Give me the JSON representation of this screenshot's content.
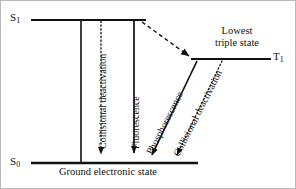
{
  "figure": {
    "type": "jablonski-energy-level-diagram",
    "stroke_color": "#111111",
    "background_color": "#ffffff",
    "border_color": "#b9b9b9"
  },
  "states": {
    "excited_singlet": {
      "label": "S",
      "subscript": "1",
      "full_label": "S1",
      "line": {
        "x1": 30,
        "x2": 145,
        "y": 19
      }
    },
    "ground_singlet": {
      "label": "S",
      "subscript": "0",
      "full_label": "S0",
      "line": {
        "x1": 30,
        "x2": 197,
        "y": 162
      }
    },
    "triplet": {
      "label": "T",
      "subscript": "1",
      "full_label": "T1",
      "line": {
        "x1": 190,
        "x2": 270,
        "y": 58
      }
    }
  },
  "annotations": {
    "ground_state_caption": "Ground electronic state",
    "lowest_triple_state_line1": "Lowest",
    "lowest_triple_state_line2": "triple state"
  },
  "transitions": [
    {
      "name": "collisional-deactivation-singlet",
      "label": "Collisional deactivation",
      "style": "dotted",
      "arrow": true,
      "from": {
        "x": 100,
        "y": 19
      },
      "to": {
        "x": 100,
        "y": 160
      }
    },
    {
      "name": "fluorescence",
      "label": "Fluorescence",
      "style": "solid",
      "arrow": true,
      "from": {
        "x": 133,
        "y": 19
      },
      "to": {
        "x": 133,
        "y": 160
      }
    },
    {
      "name": "intersystem-crossing",
      "label": "",
      "style": "dashed",
      "arrow": true,
      "from": {
        "x": 141,
        "y": 21
      },
      "to": {
        "x": 190,
        "y": 56
      }
    },
    {
      "name": "phosphorescence",
      "label": "Phosphorescence",
      "style": "solid",
      "arrow": true,
      "from": {
        "x": 196,
        "y": 60
      },
      "to": {
        "x": 149,
        "y": 159
      }
    },
    {
      "name": "collisional-deactivation-triplet",
      "label": "Collisional deactivation",
      "style": "dotted",
      "arrow": true,
      "from": {
        "x": 220,
        "y": 60
      },
      "to": {
        "x": 174,
        "y": 159
      }
    },
    {
      "name": "left-boundary-connector",
      "label": "",
      "style": "solid",
      "arrow": false,
      "from": {
        "x": 80,
        "y": 19
      },
      "to": {
        "x": 80,
        "y": 162
      }
    }
  ]
}
